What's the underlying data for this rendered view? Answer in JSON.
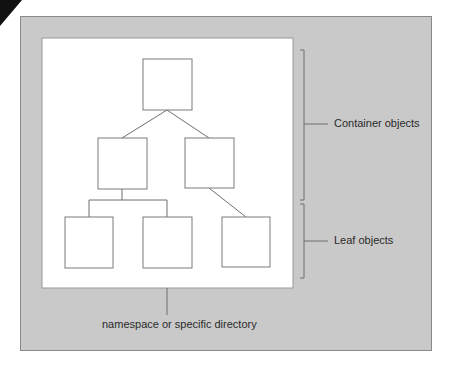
{
  "diagram": {
    "labels": {
      "container": "Container objects",
      "leaf": "Leaf objects",
      "namespace": "namespace or specific directory"
    },
    "tree": {
      "root": "container",
      "children": [
        {
          "node": "container-left",
          "children": [
            "leaf-1",
            "leaf-2"
          ]
        },
        {
          "node": "container-right",
          "children": [
            "leaf-3"
          ]
        }
      ]
    },
    "colors": {
      "panel": "#c9c9c9",
      "canvas": "#ffffff",
      "line": "#6e6e6e"
    }
  }
}
